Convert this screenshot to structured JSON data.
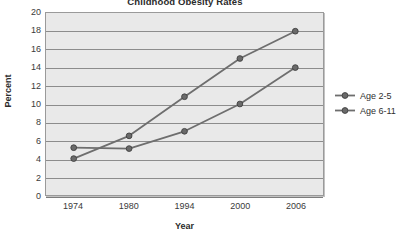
{
  "chart_data": {
    "type": "line",
    "title": "Childhood Obesity Rates",
    "xlabel": "Year",
    "ylabel": "Percent",
    "categories": [
      "1974",
      "1980",
      "1994",
      "2000",
      "2006"
    ],
    "x": [
      1974,
      1980,
      1994,
      2000,
      2006
    ],
    "series": [
      {
        "name": "Age 2-5",
        "values": [
          5.2,
          5.1,
          7.0,
          10.0,
          14.0
        ],
        "color": "#6e6e6e"
      },
      {
        "name": "Age 6-11",
        "values": [
          4.0,
          6.5,
          10.8,
          15.0,
          18.0
        ],
        "color": "#6e6e6e"
      }
    ],
    "ylim": [
      0,
      20
    ],
    "y_ticks": [
      0,
      2,
      4,
      6,
      8,
      10,
      12,
      14,
      16,
      18,
      20
    ],
    "grid": true,
    "legend_position": "right",
    "plot_background": "#e9e9e9",
    "grid_color": "#8c8c8c",
    "marker": "circle"
  },
  "legend": {
    "entries": [
      {
        "label": "Age 2-5"
      },
      {
        "label": "Age 6-11"
      }
    ]
  }
}
